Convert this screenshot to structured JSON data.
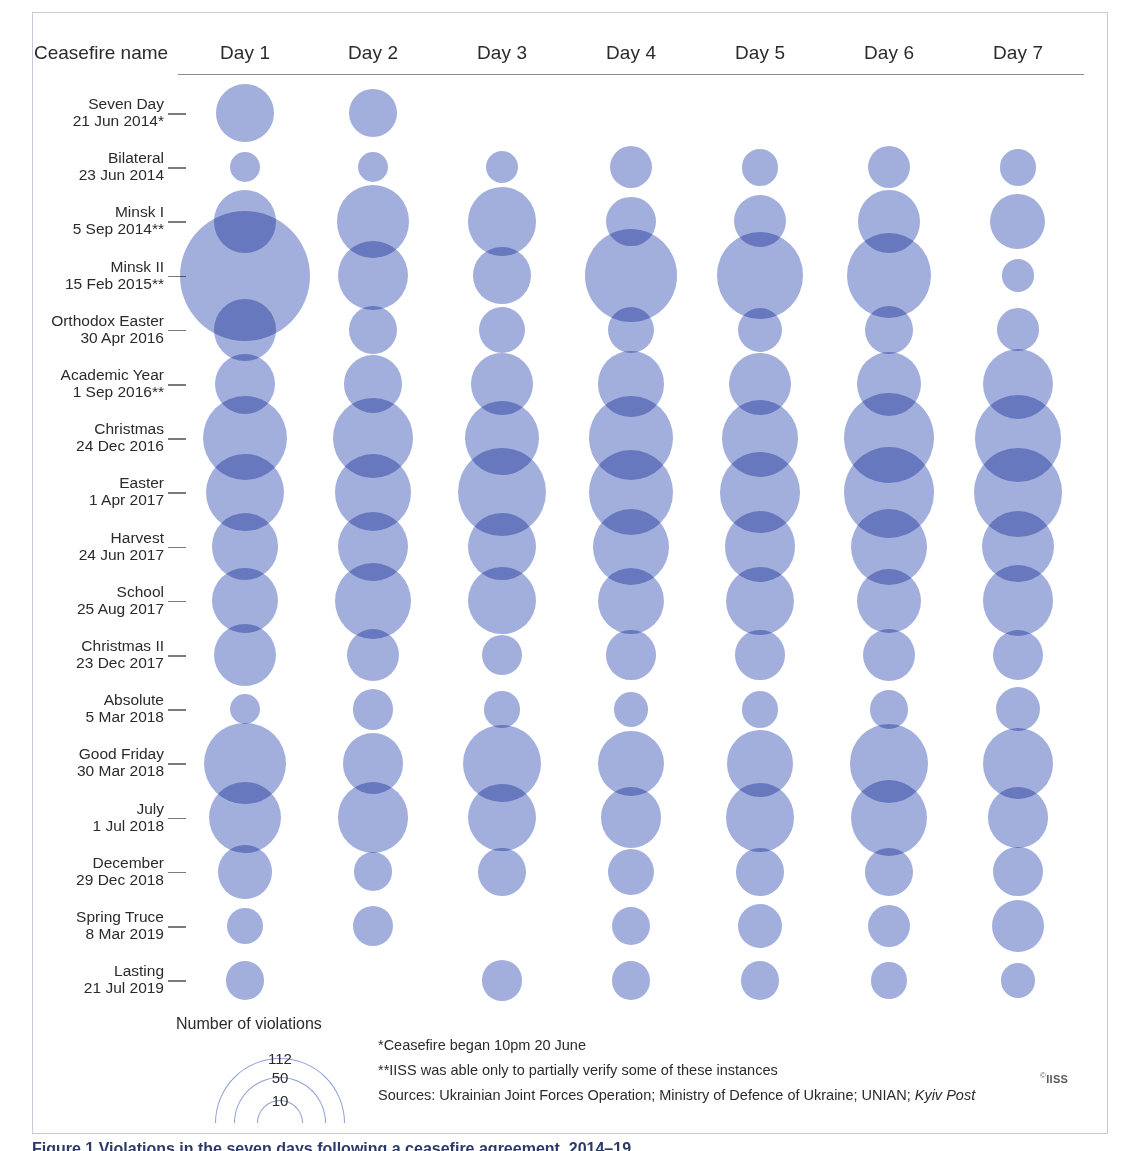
{
  "figure": {
    "row_header_label": "Ceasefire name",
    "caption": "Figure 1 Violations in the seven days following a ceasefire agreement, 2014–19",
    "copyright": "IISS",
    "copyright_symbol": "©"
  },
  "legend": {
    "title": "Number of violations",
    "values": [
      112,
      50,
      10
    ],
    "radii_px": [
      65,
      46,
      23
    ]
  },
  "notes": [
    "*Ceasefire began 10pm 20 June",
    "**IISS was able only to partially verify some of these instances"
  ],
  "sources": {
    "prefix": "Sources: Ukrainian Joint Forces Operation; Ministry of Defence of Ukraine; UNIAN; ",
    "italic": "Kyiv Post"
  },
  "colors": {
    "bubble": "#8e9ed6",
    "frame": "#c6c9d6",
    "rule": "#8a8a8a",
    "text": "#2b2b2b",
    "caption": "#2b3a6b"
  },
  "chart_data": {
    "type": "bubble",
    "xlabel": "",
    "ylabel": "",
    "size_legend": {
      "unit": "Number of violations",
      "breaks": [
        10,
        50,
        112
      ]
    },
    "categories": [
      "Day 1",
      "Day 2",
      "Day 3",
      "Day 4",
      "Day 5",
      "Day 6",
      "Day 7"
    ],
    "rows": [
      {
        "name": "Seven Day",
        "date": "21 Jun 2014*",
        "values": [
          22,
          15,
          0,
          0,
          0,
          0,
          0
        ]
      },
      {
        "name": "Bilateral",
        "date": "23 Jun 2014",
        "values": [
          6,
          6,
          7,
          12,
          9,
          12,
          9
        ]
      },
      {
        "name": "Minsk I",
        "date": "5 Sep 2014**",
        "values": [
          26,
          35,
          31,
          16,
          18,
          26,
          20
        ]
      },
      {
        "name": "Minsk II",
        "date": "15 Feb 2015**",
        "values": [
          112,
          32,
          22,
          57,
          50,
          47,
          7
        ]
      },
      {
        "name": "Orthodox Easter",
        "date": "30 Apr 2016",
        "values": [
          25,
          15,
          14,
          14,
          13,
          15,
          12
        ]
      },
      {
        "name": "Academic Year",
        "date": "1 Sep 2016**",
        "values": [
          24,
          22,
          25,
          28,
          26,
          27,
          33
        ]
      },
      {
        "name": "Christmas",
        "date": "24 Dec 2016",
        "values": [
          47,
          42,
          36,
          46,
          39,
          53,
          50
        ]
      },
      {
        "name": "Easter",
        "date": "1 Apr 2017",
        "values": [
          40,
          39,
          51,
          47,
          43,
          54,
          52
        ]
      },
      {
        "name": "Harvest",
        "date": "24 Jun 2017",
        "values": [
          29,
          32,
          30,
          38,
          33,
          38,
          34
        ]
      },
      {
        "name": "School",
        "date": "25 Aug 2017",
        "values": [
          28,
          38,
          30,
          29,
          31,
          27,
          33
        ]
      },
      {
        "name": "Christmas  II",
        "date": "23 Dec 2017",
        "values": [
          26,
          18,
          11,
          16,
          16,
          18,
          17
        ]
      },
      {
        "name": "Absolute",
        "date": "5 Mar 2018",
        "values": [
          6,
          11,
          9,
          8,
          9,
          10,
          13
        ]
      },
      {
        "name": "Good Friday",
        "date": "30 Mar 2018",
        "values": [
          44,
          24,
          40,
          28,
          29,
          41,
          33
        ]
      },
      {
        "name": "July",
        "date": "1 Jul 2018",
        "values": [
          34,
          33,
          30,
          24,
          31,
          38,
          24
        ]
      },
      {
        "name": "December",
        "date": "29 Dec 2018",
        "values": [
          19,
          10,
          15,
          14,
          15,
          15,
          16
        ]
      },
      {
        "name": "Spring Truce",
        "date": "8 Mar 2019",
        "values": [
          9,
          11,
          0,
          10,
          13,
          12,
          18
        ]
      },
      {
        "name": "Lasting",
        "date": "21 Jul 2019",
        "values": [
          10,
          0,
          11,
          10,
          10,
          9,
          8
        ]
      }
    ]
  },
  "layout": {
    "row_y_start": 113,
    "row_y_step": 54.2,
    "col_x": [
      245,
      373,
      502,
      631,
      760,
      889,
      1018
    ],
    "radius_scale": 6.15,
    "radius_exp": 0.5
  }
}
